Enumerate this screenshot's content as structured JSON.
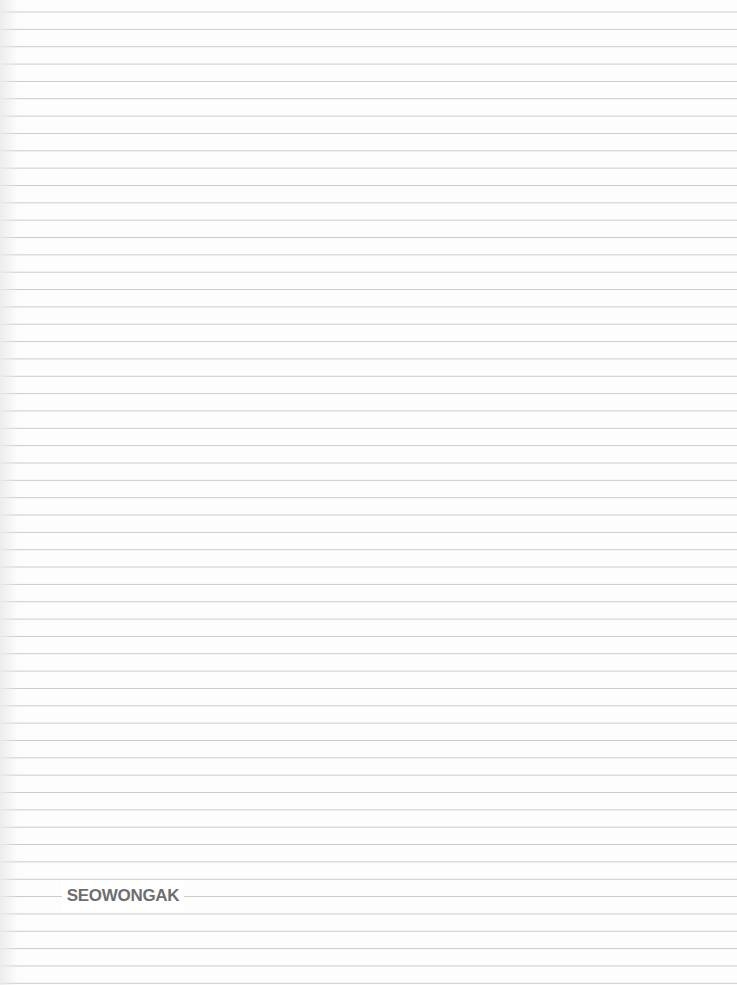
{
  "page": {
    "type": "graph-paper-sheet",
    "grid": {
      "line_color": "#969696",
      "column_spacing_px": 20,
      "row_spacing_px": 17
    }
  },
  "faint_title": "",
  "logo": {
    "text": "SEOWONGAK",
    "color": "#6e6e6e"
  }
}
